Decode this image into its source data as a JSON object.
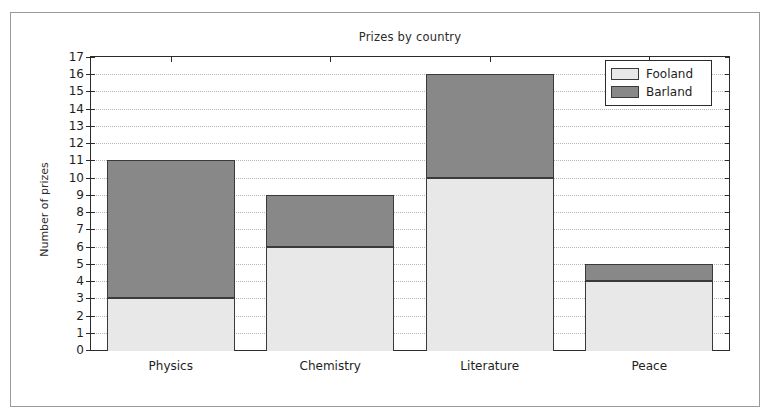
{
  "figure": {
    "title": "Prizes by country",
    "ylabel": "Number of prizes"
  },
  "legend": {
    "position": "upper-right",
    "entries": [
      {
        "label": "Fooland",
        "color": "#e8e8e8"
      },
      {
        "label": "Barland",
        "color": "#888888"
      }
    ]
  },
  "chart_data": {
    "type": "bar",
    "subtype": "stacked",
    "title": "Prizes by country",
    "xlabel": "",
    "ylabel": "Number of prizes",
    "categories": [
      "Physics",
      "Chemistry",
      "Literature",
      "Peace"
    ],
    "series": [
      {
        "name": "Fooland",
        "color": "#e8e8e8",
        "values": [
          3,
          6,
          10,
          4
        ]
      },
      {
        "name": "Barland",
        "color": "#888888",
        "values": [
          8,
          3,
          6,
          1
        ]
      }
    ],
    "totals": [
      11,
      9,
      16,
      5
    ],
    "ylim": [
      0,
      17
    ],
    "ytick_labels": [
      "0",
      "1",
      "2",
      "3",
      "4",
      "5",
      "6",
      "7",
      "8",
      "9",
      "10",
      "11",
      "12",
      "13",
      "14",
      "15",
      "16",
      "17"
    ],
    "ytick_step": 1,
    "xtick_labels": [
      "Physics",
      "Chemistry",
      "Literature",
      "Peace"
    ],
    "grid": {
      "horizontal": true,
      "vertical": false,
      "style": "dotted",
      "color": "#b4b4b4"
    },
    "legend_position": "upper right",
    "axes_color": "#2b2b2b",
    "bar_edge_color": "#3a3a3a",
    "background": "#ffffff"
  }
}
